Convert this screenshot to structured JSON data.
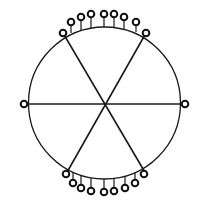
{
  "diagram": {
    "type": "wheel-with-pendant-rings",
    "colors": {
      "stroke": "#1a1a1a",
      "background": "#ffffff"
    },
    "circle": {
      "cx": 104.5,
      "cy": 103,
      "r": 76
    },
    "spokes": [
      {
        "x1": 24,
        "y1": 104,
        "x2": 185,
        "y2": 104
      },
      {
        "x1": 63,
        "y1": 33,
        "x2": 146,
        "y2": 174
      },
      {
        "x1": 146,
        "y1": 33,
        "x2": 66,
        "y2": 174
      }
    ],
    "end_rings": [
      {
        "x": 24,
        "y": 104
      },
      {
        "x": 185,
        "y": 104
      },
      {
        "x": 63,
        "y": 33
      },
      {
        "x": 146,
        "y": 33
      },
      {
        "x": 66,
        "y": 174
      },
      {
        "x": 144,
        "y": 174
      }
    ],
    "top_pendants": [
      {
        "x": 71,
        "y": 22,
        "base_y": 33
      },
      {
        "x": 81,
        "y": 17,
        "base_y": 30
      },
      {
        "x": 91,
        "y": 14,
        "base_y": 28
      },
      {
        "x": 104,
        "y": 14,
        "base_y": 27
      },
      {
        "x": 114,
        "y": 14,
        "base_y": 28
      },
      {
        "x": 124,
        "y": 17,
        "base_y": 29
      },
      {
        "x": 136,
        "y": 22,
        "base_y": 32
      }
    ],
    "bottom_pendants": [
      {
        "x": 73,
        "y": 183,
        "base_y": 172
      },
      {
        "x": 81,
        "y": 188,
        "base_y": 176
      },
      {
        "x": 91,
        "y": 191,
        "base_y": 178
      },
      {
        "x": 104,
        "y": 192,
        "base_y": 179
      },
      {
        "x": 114,
        "y": 191,
        "base_y": 178
      },
      {
        "x": 125,
        "y": 188,
        "base_y": 177
      },
      {
        "x": 135,
        "y": 183,
        "base_y": 173
      }
    ]
  }
}
